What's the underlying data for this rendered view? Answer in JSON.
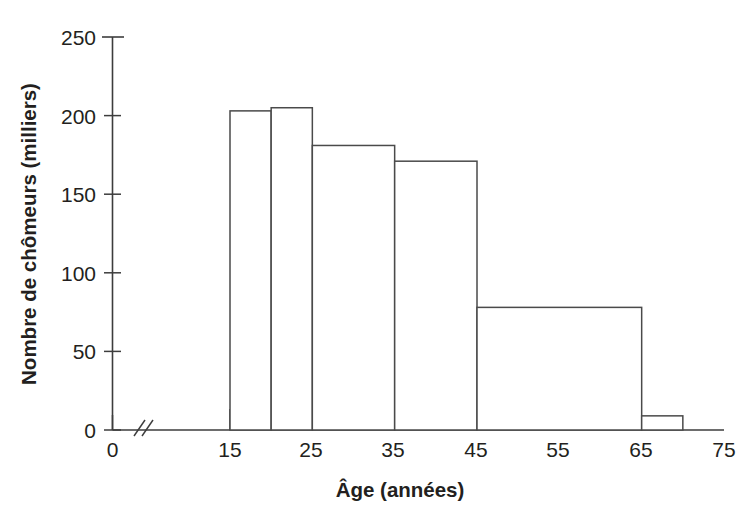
{
  "chart_data": {
    "type": "bar",
    "title": "",
    "subtitle": "",
    "xlabel": "Âge (années)",
    "ylabel": "Nombre de chômeurs (milliers)",
    "xlim": [
      0,
      75
    ],
    "ylim": [
      0,
      250
    ],
    "grid": false,
    "legend": null,
    "axis_break": {
      "axis": "x",
      "between": [
        0,
        15
      ],
      "symbol": "//"
    },
    "x_ticks": [
      0,
      15,
      25,
      35,
      45,
      55,
      65,
      75
    ],
    "x_tick_labels": [
      "0",
      "15",
      "25",
      "35",
      "45",
      "55",
      "65",
      "75"
    ],
    "y_ticks": [
      0,
      50,
      100,
      150,
      200,
      250
    ],
    "y_tick_labels": [
      "0",
      "50",
      "100",
      "150",
      "200",
      "250"
    ],
    "bin_edges": [
      15,
      20,
      25,
      35,
      45,
      65,
      70
    ],
    "categories": [
      "15-20",
      "20-25",
      "25-35",
      "35-45",
      "45-65",
      "65-70"
    ],
    "values": [
      203,
      205,
      181,
      171,
      78,
      9
    ],
    "bars": [
      {
        "label": "15-20",
        "x_start": 15,
        "x_end": 20,
        "value": 203
      },
      {
        "label": "20-25",
        "x_start": 20,
        "x_end": 25,
        "value": 205
      },
      {
        "label": "25-35",
        "x_start": 25,
        "x_end": 35,
        "value": 181
      },
      {
        "label": "35-45",
        "x_start": 35,
        "x_end": 45,
        "value": 171
      },
      {
        "label": "45-65",
        "x_start": 45,
        "x_end": 65,
        "value": 78
      },
      {
        "label": "65-70",
        "x_start": 65,
        "x_end": 70,
        "value": 9
      }
    ],
    "colors": {
      "bar_fill": "#ffffff",
      "bar_stroke": "#4a4a4a",
      "axis": "#3d3d3d",
      "text": "#231f20",
      "background": "#ffffff"
    }
  }
}
